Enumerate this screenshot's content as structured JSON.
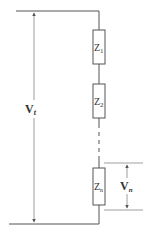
{
  "diagram": {
    "type": "series-impedance-circuit",
    "colors": {
      "line": "#555555",
      "text": "#333333",
      "background": "#ffffff"
    },
    "voltage_total": {
      "label": "V",
      "subscript": "t"
    },
    "voltage_n": {
      "label": "V",
      "subscript": "n"
    },
    "impedances": [
      {
        "label": "Z",
        "subscript": "1"
      },
      {
        "label": "Z",
        "subscript": "2"
      },
      {
        "label": "Z",
        "subscript": "n"
      }
    ]
  }
}
